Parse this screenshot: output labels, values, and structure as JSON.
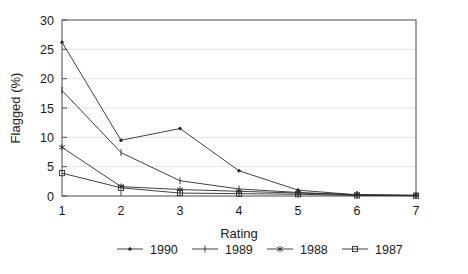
{
  "chart_data": {
    "type": "line",
    "title": "",
    "xlabel": "Rating",
    "ylabel": "Flagged (%)",
    "x": [
      1,
      2,
      3,
      4,
      5,
      6,
      7
    ],
    "xlim": [
      1,
      7
    ],
    "ylim": [
      0,
      30
    ],
    "yticks": [
      0,
      5,
      10,
      15,
      20,
      25,
      30
    ],
    "xticks": [
      1,
      2,
      3,
      4,
      5,
      6,
      7
    ],
    "grid": "horizontal",
    "legend_position": "bottom-center",
    "series": [
      {
        "name": "1990",
        "marker": "dot",
        "values": [
          26.2,
          9.5,
          11.5,
          4.3,
          1.0,
          0.2,
          0.1
        ]
      },
      {
        "name": "1989",
        "marker": "vertical-bar",
        "values": [
          18.0,
          7.4,
          2.6,
          1.2,
          0.6,
          0.2,
          0.1
        ]
      },
      {
        "name": "1988",
        "marker": "star",
        "values": [
          8.3,
          1.6,
          1.1,
          0.8,
          0.5,
          0.2,
          0.1
        ]
      },
      {
        "name": "1987",
        "marker": "square",
        "values": [
          3.9,
          1.4,
          0.5,
          0.4,
          0.3,
          0.1,
          0.05
        ]
      }
    ]
  },
  "axis": {
    "y_title": "Flagged (%)",
    "x_title": "Rating",
    "y_tick_labels": [
      "0",
      "5",
      "10",
      "15",
      "20",
      "25",
      "30"
    ],
    "x_tick_labels": [
      "1",
      "2",
      "3",
      "4",
      "5",
      "6",
      "7"
    ]
  },
  "legend": {
    "entries": [
      {
        "label": "1990"
      },
      {
        "label": "1989"
      },
      {
        "label": "1988"
      },
      {
        "label": "1987"
      }
    ]
  },
  "colors": {
    "line": "#2b2b2b",
    "frame": "#4a4a4a",
    "grid": "#d8d8d8",
    "background": "#ffffff",
    "text": "#1a1a1a"
  }
}
